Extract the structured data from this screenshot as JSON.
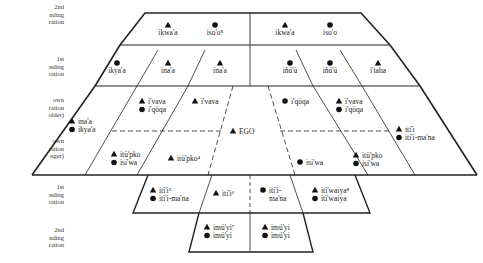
{
  "row_labels": [
    {
      "text": "2nd\nnding\nration",
      "top": 3
    },
    {
      "text": "1st\nnding\nration",
      "top": 55
    },
    {
      "text": "own\nration\nolder)",
      "top": 96
    },
    {
      "text": "own\nration\nnger)",
      "top": 137
    },
    {
      "text": "1st\nnding\nration",
      "top": 183
    },
    {
      "text": "2nd\nnding\nration",
      "top": 226
    }
  ],
  "cells": {
    "r1c1": [
      {
        "sym": "triangle",
        "term": "ikwa'a"
      }
    ],
    "r1c2": [
      {
        "sym": "circle",
        "term": "iso'o⁸"
      }
    ],
    "r1c3": [
      {
        "sym": "triangle",
        "term": "ikwa'a"
      }
    ],
    "r1c4": [
      {
        "sym": "circle",
        "term": "iso'o"
      }
    ],
    "r2c1": [
      {
        "sym": "circle",
        "term": "ikya'a"
      }
    ],
    "r2c2": [
      {
        "sym": "triangle",
        "term": "ina'a"
      }
    ],
    "r2c3": [
      {
        "sym": "triangle",
        "term": "ina'a"
      }
    ],
    "r2c4": [
      {
        "sym": "circle",
        "term": "iñü'ü"
      }
    ],
    "r2c5": [
      {
        "sym": "circle",
        "term": "iñü'ü"
      }
    ],
    "r2c6": [
      {
        "sym": "triangle",
        "term": "i'taha"
      }
    ],
    "r3_left_outer": [
      {
        "sym": "triangle",
        "term": "ina'a"
      },
      {
        "sym": "circle",
        "term": "ikya'a"
      }
    ],
    "r3_older_left": [
      {
        "sym": "triangle",
        "term": "i'vava"
      },
      {
        "sym": "circle",
        "term": "i'qöqa"
      }
    ],
    "r3_older_mid_left": [
      {
        "sym": "triangle",
        "term": "i'vava"
      }
    ],
    "ego": [
      {
        "sym": "triangle",
        "term": "EGO"
      }
    ],
    "r3_older_mid_right": [
      {
        "sym": "circle",
        "term": "i'qöqa"
      }
    ],
    "r3_older_right": [
      {
        "sym": "triangle",
        "term": "i'vava"
      },
      {
        "sym": "circle",
        "term": "i'qöqa"
      }
    ],
    "r3_right_outer": [
      {
        "sym": "triangle",
        "term": "iti'i"
      },
      {
        "sym": "circle",
        "term": "iti'i-ma'na"
      }
    ],
    "r3_younger_left": [
      {
        "sym": "triangle",
        "term": "itü'pko"
      },
      {
        "sym": "circle",
        "term": "isi'wa"
      }
    ],
    "r3_younger_mid_left": [
      {
        "sym": "triangle",
        "term": "itü'pko⁴"
      }
    ],
    "r3_younger_mid_right": [
      {
        "sym": "circle",
        "term": "isi'wa"
      }
    ],
    "r3_younger_right": [
      {
        "sym": "triangle",
        "term": "itü'pko"
      },
      {
        "sym": "circle",
        "term": "isi'wa"
      }
    ],
    "r4c1": [
      {
        "sym": "triangle",
        "term": "iti'i⁵"
      },
      {
        "sym": "circle",
        "term": "iti'i-ma'na"
      }
    ],
    "r4c2": [
      {
        "sym": "triangle",
        "term": "iti'i⁶"
      }
    ],
    "r4c3": [
      {
        "sym": "circle",
        "term": "iti'i-"
      },
      {
        "sym": "none",
        "term": "ma'na"
      }
    ],
    "r4c4": [
      {
        "sym": "triangle",
        "term": "iti'waiya⁸"
      },
      {
        "sym": "circle",
        "term": "iti'waiya"
      }
    ],
    "r5c1": [
      {
        "sym": "triangle",
        "term": "imü'yi⁷"
      },
      {
        "sym": "circle",
        "term": "imü'yi"
      }
    ],
    "r5c2": [
      {
        "sym": "triangle",
        "term": "imü'yi"
      },
      {
        "sym": "circle",
        "term": "imü'yi"
      }
    ]
  },
  "colors": {
    "line": "#222222",
    "text": "#222222",
    "background": "#ffffff"
  }
}
